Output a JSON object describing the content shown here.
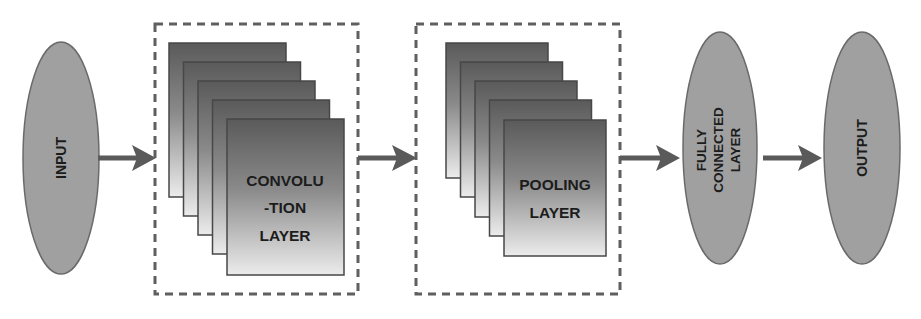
{
  "diagram": {
    "colors": {
      "ellipse_fill": "#a0a0a0",
      "ellipse_stroke": "#6a6a6a",
      "arrow": "#5a5a5a",
      "dashed_border": "#5f5f5f",
      "page_dark": "#5e5e5e",
      "page_light": "#e8e8e8",
      "page_stroke": "#474747",
      "text": "#1c1c1c"
    },
    "nodes": {
      "input": {
        "label": "INPUT"
      },
      "convolution": {
        "lines": [
          "CONVOLU",
          "-TION",
          "LAYER"
        ],
        "stack_count": 5
      },
      "pooling": {
        "lines": [
          "POOLING",
          "LAYER"
        ],
        "stack_count": 5
      },
      "fully_connected": {
        "lines": [
          "FULLY",
          "CONNECTED",
          "LAYER"
        ]
      },
      "output": {
        "label": "OUTPUT"
      }
    },
    "edges": [
      {
        "from": "INPUT",
        "to": "CONVOLUTION LAYER"
      },
      {
        "from": "CONVOLUTION LAYER",
        "to": "POOLING LAYER"
      },
      {
        "from": "POOLING LAYER",
        "to": "FULLY CONNECTED LAYER"
      },
      {
        "from": "FULLY CONNECTED LAYER",
        "to": "OUTPUT"
      }
    ]
  }
}
